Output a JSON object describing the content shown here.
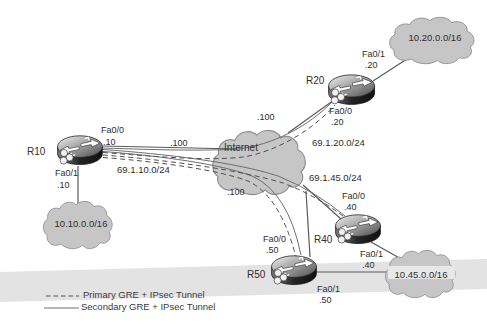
{
  "figure": {
    "type": "network-topology"
  },
  "clouds": {
    "internet": "Internet",
    "lan_r10": "10.10.0.0/16",
    "lan_r20": "10.20.0.0/16",
    "lan_shared": "10.45.0.0/16"
  },
  "wan_networks": {
    "r10": "69.1.10.0/24",
    "r20": "69.1.20.0/24",
    "shared": "69.1.45.0/24"
  },
  "internet_side_ips": {
    "r10_link": ".100",
    "r20_link": ".100",
    "shared_link": ".100"
  },
  "routers": {
    "r10": {
      "name": "R10",
      "wan_if": "Fa0/0",
      "wan_ip": ".10",
      "lan_if": "Fa0/1",
      "lan_ip": ".10"
    },
    "r20": {
      "name": "R20",
      "wan_if": "Fa0/0",
      "wan_ip": ".20",
      "lan_if": "Fa0/1",
      "lan_ip": ".20"
    },
    "r40": {
      "name": "R40",
      "wan_if": "Fa0/0",
      "wan_ip": ".40",
      "lan_if": "Fa0/1",
      "lan_ip": ".40"
    },
    "r50": {
      "name": "R50",
      "wan_if": "Fa0/0",
      "wan_ip": ".50",
      "lan_if": "Fa0/1",
      "lan_ip": ".50"
    }
  },
  "legend": {
    "primary_label": "Primary GRE + IPsec Tunnel",
    "secondary_label": "Secondary GRE + IPsec Tunnel"
  },
  "colors": {
    "cloud_fill": "#c6c6c6",
    "cloud_stroke": "#8c8c8c",
    "line": "#555555",
    "dashed_tunnel": "#4f4f4f",
    "solid_tunnel": "#6e6e6e",
    "page_band": "#e3e3e3",
    "text": "#2e2e2e"
  }
}
